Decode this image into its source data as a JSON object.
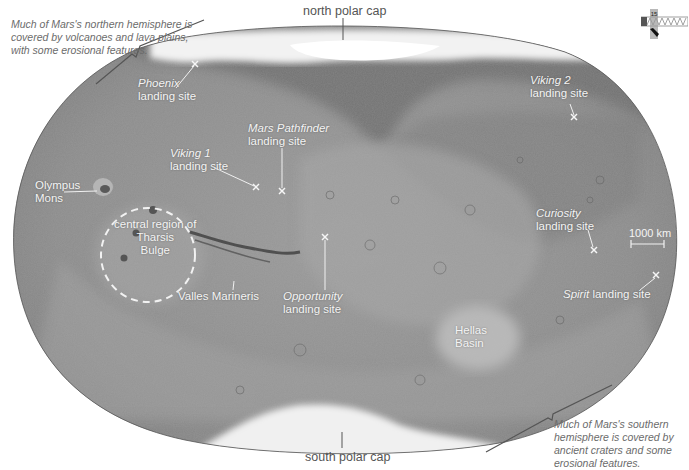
{
  "map": {
    "subject": "Mars global map",
    "projection_shape": "oval",
    "colors": {
      "surface": "#8e8e8e",
      "surface_dark": "#6e6e6e",
      "surface_light": "#a8a8a8",
      "polar_ice": "#f2f2f2",
      "label_text": "#f4f4f4",
      "note_text": "#6b6b6b",
      "background": "#ffffff"
    }
  },
  "notes": {
    "north": "Much of Mars's northern hemisphere is covered by volcanoes and lava plains, with some erosional features.",
    "north_lines": [
      "Much of Mars's northern hemisphere is",
      "covered by volcanoes and lava plains,",
      "with some erosional features."
    ],
    "south_lines": [
      "Much of Mars's southern",
      "hemisphere is covered by",
      "ancient craters and some",
      "erosional features."
    ]
  },
  "polar_caps": {
    "north": "north polar cap",
    "south": "south polar cap"
  },
  "features": {
    "olympus_mons": [
      "Olympus",
      "Mons"
    ],
    "tharsis": [
      "central region of",
      "Tharsis",
      "Bulge"
    ],
    "valles_marineris": "Valles Marineris",
    "hellas_basin": [
      "Hellas",
      "Basin"
    ]
  },
  "landing_sites": [
    {
      "name": "Phoenix",
      "suffix": "landing site"
    },
    {
      "name": "Viking 1",
      "suffix": "landing site"
    },
    {
      "name": "Mars Pathfinder",
      "suffix": "landing site"
    },
    {
      "name": "Viking 2",
      "suffix": "landing site"
    },
    {
      "name": "Opportunity",
      "suffix": "landing site"
    },
    {
      "name": "Curiosity",
      "suffix": "landing site"
    },
    {
      "name": "Spirit",
      "suffix": "landing site"
    }
  ],
  "scale_bar": {
    "label": "1000 km"
  },
  "locator": {
    "label": "15"
  }
}
